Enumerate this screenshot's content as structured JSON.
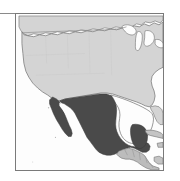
{
  "figure": {
    "type": "range-map",
    "title": "Distribution map of North and Central America",
    "caption": "",
    "frame_visible": true,
    "frame_color": "#7a7a7a",
    "background_color": "#ffffff"
  },
  "map_data": {
    "projection_note": "North America, Mexico-centered thumbnail",
    "ocean_color": "#fdfdfd",
    "coastline_color": "#6e6e6e",
    "border_color": "#8f8f8f",
    "legend_visible": false,
    "labels_visible": false,
    "regions": [
      {
        "name": "Canada",
        "label": "Canada",
        "fill": "#d4d4d4",
        "highlighted": false
      },
      {
        "name": "United States",
        "label": "United States",
        "fill": "#d4d4d4",
        "highlighted": false
      },
      {
        "name": "Mexico",
        "label": "Mexico",
        "fill": "#4a4a4a",
        "highlighted": true
      },
      {
        "name": "Central America",
        "label": "Central America",
        "fill": "#bcbcbc",
        "highlighted": false
      },
      {
        "name": "Caribbean",
        "label": "Cuba and Greater Antilles",
        "fill": "#c4c4c4",
        "highlighted": false
      }
    ],
    "water_bodies": [
      {
        "name": "Pacific Ocean",
        "label": "Pacific Ocean"
      },
      {
        "name": "Gulf of Mexico",
        "label": "Gulf of Mexico"
      },
      {
        "name": "Gulf of California",
        "label": "Gulf of California"
      },
      {
        "name": "Atlantic Ocean",
        "label": "Atlantic Ocean"
      },
      {
        "name": "Great Lakes",
        "label": "Great Lakes"
      }
    ]
  }
}
